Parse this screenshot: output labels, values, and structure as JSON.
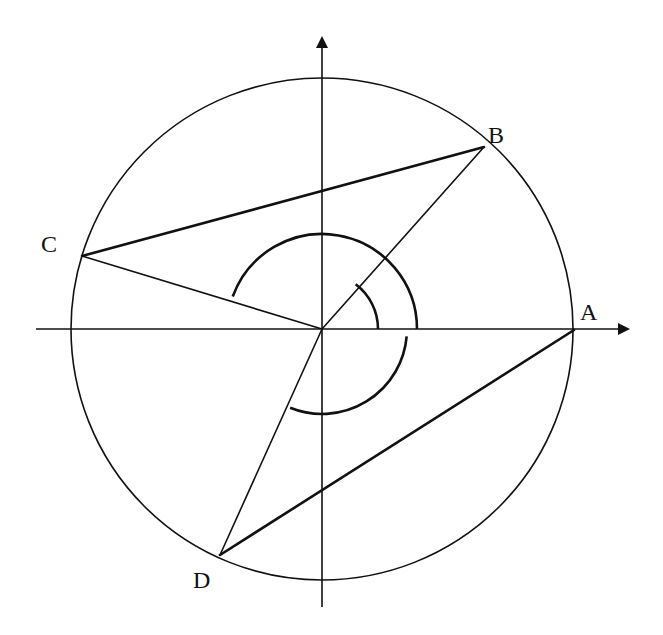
{
  "diagram": {
    "type": "circle-with-inscribed-quadrilateral",
    "colors": {
      "stroke": "#111111",
      "background": "#ffffff"
    },
    "center": {
      "x": 322,
      "y": 329
    },
    "radius": 251,
    "axes": {
      "x": {
        "from": [
          36,
          329
        ],
        "to": [
          628,
          329
        ]
      },
      "y": {
        "from": [
          322,
          607
        ],
        "to": [
          322,
          38
        ]
      }
    },
    "points": {
      "A": {
        "label": "A",
        "x": 574,
        "y": 330,
        "lx": 580,
        "ly": 320
      },
      "B": {
        "label": "B",
        "x": 484,
        "y": 147,
        "lx": 488,
        "ly": 143
      },
      "C": {
        "label": "C",
        "x": 82,
        "y": 256,
        "lx": 41,
        "ly": 252
      },
      "D": {
        "label": "D",
        "x": 220,
        "y": 555,
        "lx": 193,
        "ly": 588
      }
    },
    "chords": [
      [
        "A",
        "D"
      ],
      [
        "B",
        "C"
      ]
    ],
    "radii": [
      "B",
      "C",
      "D"
    ],
    "angle_arcs": [
      {
        "name": "angle-B",
        "r": 56,
        "start_deg": 0,
        "end_deg": 53
      },
      {
        "name": "angle-C",
        "r": 95,
        "start_deg": 0,
        "end_deg": 160
      },
      {
        "name": "angle-D",
        "r": 85,
        "start_deg": -5,
        "end_deg": -112
      }
    ]
  }
}
